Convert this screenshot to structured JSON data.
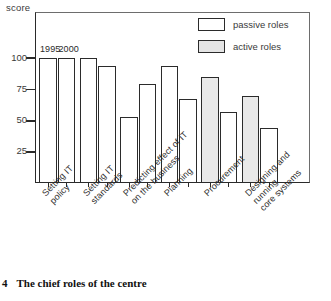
{
  "caption": {
    "number": "4",
    "text": "The chief roles of the centre"
  },
  "chart_data": {
    "type": "bar",
    "title": "The chief roles of the centre",
    "xlabel": "",
    "ylabel": "score",
    "ylim": [
      0,
      112
    ],
    "yticks": [
      25,
      50,
      75,
      100
    ],
    "ytick_labels": [
      "25",
      "50",
      "75",
      "100"
    ],
    "grid": false,
    "legend_position": "top-right",
    "series_annotation": [
      "1995",
      "2000"
    ],
    "categories": [
      "Setting IT\npolicy",
      "Setting IT\nstandards",
      "Predicting effect of IT\non the business",
      "Planning",
      "Procurement",
      "Designing and running\ncore systems"
    ],
    "series": [
      {
        "name": "1995",
        "values": [
          100,
          100,
          53,
          94,
          85,
          70
        ],
        "roles": [
          "passive",
          "passive",
          "passive",
          "passive",
          "active",
          "active"
        ]
      },
      {
        "name": "2000",
        "values": [
          100,
          94,
          79,
          67,
          57,
          44
        ],
        "roles": [
          "passive",
          "passive",
          "passive",
          "passive",
          "passive",
          "passive"
        ]
      }
    ],
    "legend": [
      {
        "label": "passive roles",
        "style": "passive",
        "color": "#ffffff"
      },
      {
        "label": "active roles",
        "style": "active",
        "color": "#e4e4e4"
      }
    ]
  }
}
